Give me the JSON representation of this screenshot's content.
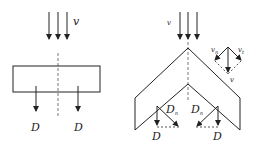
{
  "left_panel": {
    "flow_label": "v",
    "force_labels": [
      "D",
      "D"
    ]
  },
  "right_panel": {
    "flow_label": "v",
    "force_labels": [
      "D",
      "D"
    ],
    "component_labels": [
      "D",
      "D"
    ],
    "component_subscript": "n",
    "vector_diagram": {
      "resultant_label": "v",
      "left_label": "v",
      "left_subscript": "n",
      "right_label": "v",
      "right_subscript": "t"
    }
  },
  "colors": {
    "stroke": "#222222",
    "dashed": "#555555",
    "background": "#ffffff"
  }
}
